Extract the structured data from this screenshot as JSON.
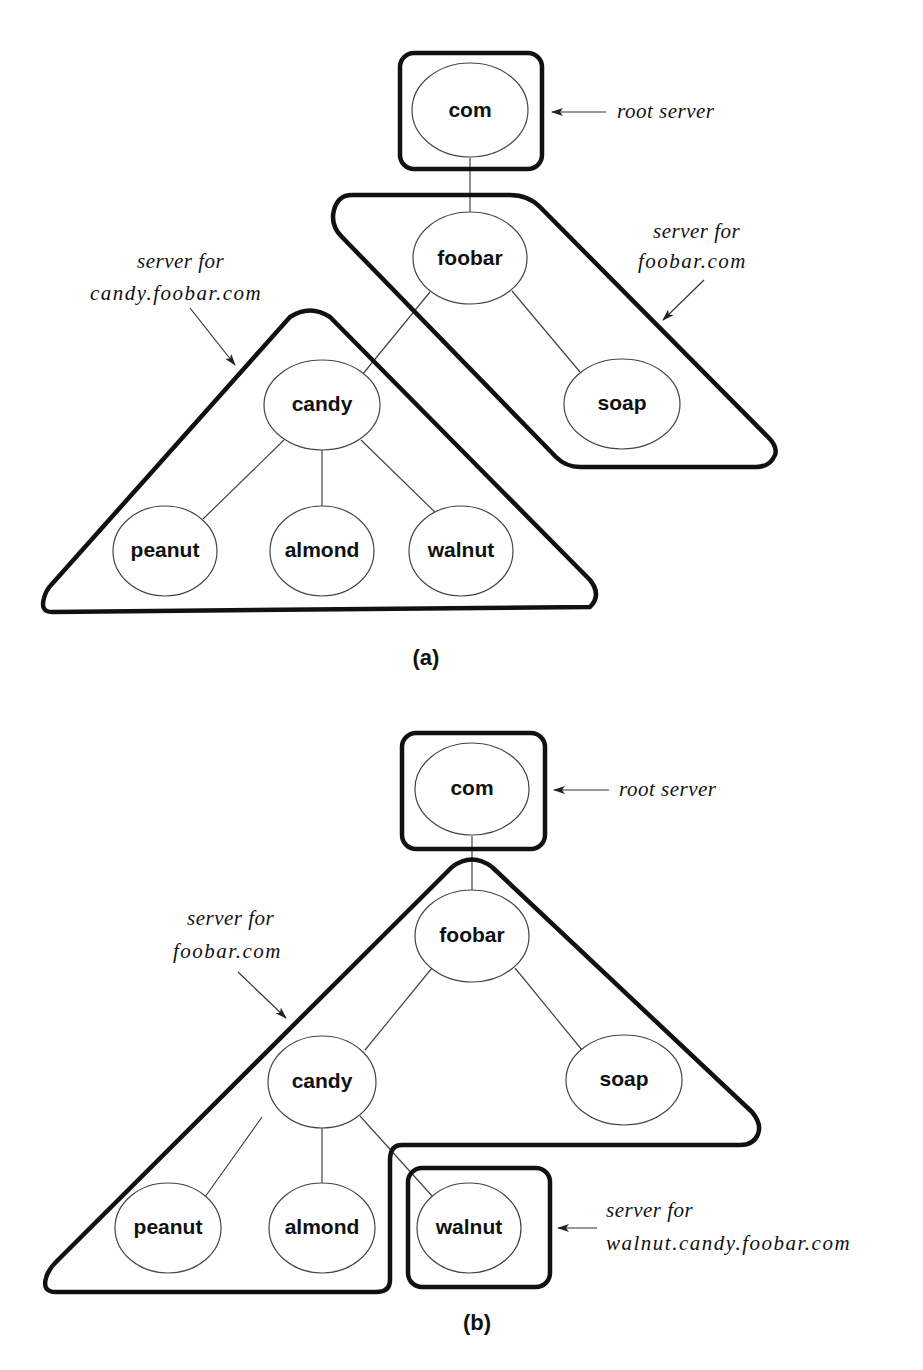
{
  "figure_a": {
    "caption": "(a)",
    "nodes": {
      "com": "com",
      "foobar": "foobar",
      "soap": "soap",
      "candy": "candy",
      "peanut": "peanut",
      "almond": "almond",
      "walnut": "walnut"
    },
    "annotations": {
      "root": "root server",
      "foobar_line1": "server for",
      "foobar_line2": "foobar.com",
      "candy_line1": "server for",
      "candy_line2": "candy.foobar.com"
    }
  },
  "figure_b": {
    "caption": "(b)",
    "nodes": {
      "com": "com",
      "foobar": "foobar",
      "soap": "soap",
      "candy": "candy",
      "peanut": "peanut",
      "almond": "almond",
      "walnut": "walnut"
    },
    "annotations": {
      "root": "root server",
      "foobar_line1": "server for",
      "foobar_line2": "foobar.com",
      "walnut_line1": "server for",
      "walnut_line2": "walnut.candy.foobar.com"
    }
  },
  "colors": {
    "zone_stroke": "#111111",
    "edge_stroke": "#444444",
    "background": "#ffffff"
  }
}
